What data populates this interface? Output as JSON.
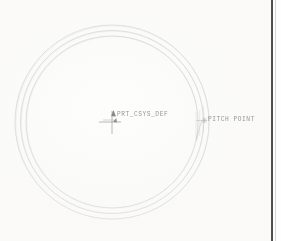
{
  "drawing": {
    "background_color": "#fdfdfc",
    "line_color": "#b9b9bc",
    "text_color": "#8d8d90",
    "border_color": "#3c3c3e",
    "view_type": "gear-pitch-circle-detail",
    "center": {
      "x": 112,
      "y": 122
    },
    "circles": [
      {
        "name": "outer-addendum-circle",
        "radius": 97,
        "style": "thin-solid"
      },
      {
        "name": "pitch-circle",
        "radius": 92,
        "style": "thin-solid"
      },
      {
        "name": "root-circle",
        "radius": 86,
        "style": "thin-solid"
      }
    ],
    "csys": {
      "label": "PRT_CSYS_DEF",
      "marker": "csys-cross-marker",
      "x_axis_arrow": "arrow-right",
      "y_axis_arrow": "arrow-up"
    },
    "annotations": [
      {
        "name": "pitch-point",
        "label": "PITCH POINT",
        "marker": "asterisk-point-marker",
        "leader": "leader-line",
        "anchor_x": 196,
        "anchor_y": 122
      }
    ],
    "border": {
      "name": "sheet-border-right",
      "orientation": "vertical",
      "position": "right"
    }
  }
}
